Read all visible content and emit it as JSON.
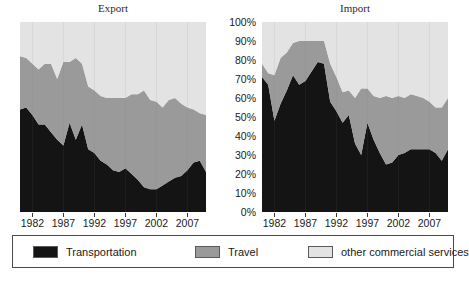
{
  "chart_data": [
    {
      "type": "area",
      "title": "Export",
      "xlabel": "",
      "ylabel": "",
      "stacked": true,
      "percent": true,
      "ylim": [
        0,
        100
      ],
      "xlim": [
        1980,
        2010
      ],
      "grid": false,
      "legend_position": "bottom",
      "ytick_labels": [
        "100%",
        "90%",
        "80%",
        "70%",
        "60%",
        "50%",
        "40%",
        "30%",
        "20%",
        "10%",
        "0%"
      ],
      "xtick_labels": [
        "1982",
        "1987",
        "1992",
        "1997",
        "2002",
        "2007"
      ],
      "xticks": [
        1982,
        1987,
        1992,
        1997,
        2002,
        2007
      ],
      "x": [
        1980,
        1981,
        1982,
        1983,
        1984,
        1985,
        1986,
        1987,
        1988,
        1989,
        1990,
        1991,
        1992,
        1993,
        1994,
        1995,
        1996,
        1997,
        1998,
        1999,
        2000,
        2001,
        2002,
        2003,
        2004,
        2005,
        2006,
        2007,
        2008,
        2009,
        2010
      ],
      "series": [
        {
          "name": "Transportation",
          "color": "#141414",
          "values": [
            54,
            55,
            51,
            46,
            46,
            42,
            38,
            35,
            47,
            38,
            46,
            33,
            31,
            27,
            25,
            22,
            21,
            23,
            20,
            17,
            13,
            12,
            12,
            14,
            16,
            18,
            19,
            22,
            26,
            27,
            21
          ]
        },
        {
          "name": "Travel",
          "color": "#9a9a9a",
          "values": [
            28,
            26,
            27,
            29,
            32,
            36,
            32,
            44,
            32,
            43,
            32,
            33,
            33,
            34,
            35,
            38,
            39,
            37,
            42,
            45,
            51,
            47,
            46,
            41,
            43,
            42,
            38,
            33,
            28,
            25,
            30
          ]
        },
        {
          "name": "other commercial services",
          "color": "#e3e3e3",
          "values": [
            18,
            19,
            22,
            25,
            22,
            22,
            30,
            21,
            21,
            19,
            22,
            34,
            36,
            39,
            40,
            40,
            40,
            40,
            38,
            38,
            36,
            41,
            42,
            45,
            41,
            40,
            43,
            45,
            46,
            48,
            49
          ]
        }
      ]
    },
    {
      "type": "area",
      "title": "Import",
      "xlabel": "",
      "ylabel": "",
      "stacked": true,
      "percent": true,
      "ylim": [
        0,
        100
      ],
      "xlim": [
        1980,
        2010
      ],
      "grid": false,
      "legend_position": "bottom",
      "ytick_labels": [
        "100%",
        "90%",
        "80%",
        "70%",
        "60%",
        "50%",
        "40%",
        "30%",
        "20%",
        "10%",
        "0%"
      ],
      "xtick_labels": [
        "1982",
        "1987",
        "1992",
        "1997",
        "2002",
        "2007"
      ],
      "xticks": [
        1982,
        1987,
        1992,
        1997,
        2002,
        2007
      ],
      "x": [
        1980,
        1981,
        1982,
        1983,
        1984,
        1985,
        1986,
        1987,
        1988,
        1989,
        1990,
        1991,
        1992,
        1993,
        1994,
        1995,
        1996,
        1997,
        1998,
        1999,
        2000,
        2001,
        2002,
        2003,
        2004,
        2005,
        2006,
        2007,
        2008,
        2009,
        2010
      ],
      "series": [
        {
          "name": "Transportation",
          "color": "#141414",
          "values": [
            71,
            67,
            48,
            57,
            64,
            72,
            67,
            69,
            74,
            79,
            78,
            58,
            53,
            47,
            51,
            36,
            30,
            47,
            38,
            31,
            25,
            26,
            30,
            31,
            33,
            33,
            33,
            33,
            31,
            27,
            33
          ]
        },
        {
          "name": "Travel",
          "color": "#9a9a9a",
          "values": [
            7,
            6,
            24,
            24,
            20,
            17,
            23,
            21,
            16,
            11,
            12,
            20,
            18,
            16,
            13,
            24,
            35,
            18,
            23,
            29,
            36,
            34,
            31,
            29,
            29,
            28,
            27,
            25,
            24,
            28,
            27
          ]
        },
        {
          "name": "other commercial services",
          "color": "#e3e3e3",
          "values": [
            22,
            27,
            28,
            19,
            16,
            11,
            10,
            10,
            10,
            10,
            10,
            22,
            29,
            37,
            36,
            40,
            35,
            35,
            39,
            40,
            39,
            40,
            39,
            40,
            38,
            39,
            40,
            42,
            45,
            45,
            40
          ]
        }
      ]
    }
  ],
  "panels": {
    "export": {
      "title": "Export"
    },
    "import": {
      "title": "Import"
    }
  },
  "y_axis": {
    "labels": [
      "100%",
      "90%",
      "80%",
      "70%",
      "60%",
      "50%",
      "40%",
      "30%",
      "20%",
      "10%",
      "0%"
    ]
  },
  "x_axis": {
    "labels": [
      "1982",
      "1987",
      "1992",
      "1997",
      "2002",
      "2007"
    ]
  },
  "legend": {
    "items": [
      {
        "label": "Transportation",
        "color": "#141414"
      },
      {
        "label": "Travel",
        "color": "#9a9a9a"
      },
      {
        "label": "other commercial services",
        "color": "#e3e3e3"
      }
    ]
  }
}
